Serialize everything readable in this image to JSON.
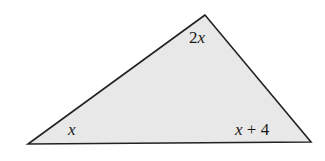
{
  "figure": {
    "type": "triangle",
    "fill_color": "#e8e8e8",
    "stroke_color": "#222222",
    "vertices": {
      "apex": [
        205,
        15
      ],
      "bottom_left": [
        28,
        144
      ],
      "bottom_right": [
        311,
        142
      ]
    },
    "angle_labels": {
      "apex": {
        "coef": "2",
        "var": "x"
      },
      "bottom_left": {
        "var": "x"
      },
      "bottom_right": {
        "var": "x",
        "rest": " + 4"
      }
    }
  }
}
